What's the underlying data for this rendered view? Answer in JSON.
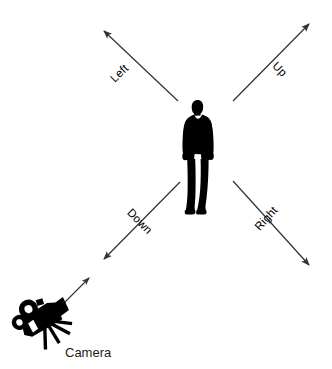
{
  "figure": {
    "background_color": "#ffffff",
    "stroke_color": "#333333",
    "silhouette_color": "#000000"
  },
  "subject": {
    "name": "person-silhouette",
    "description": "standing man silhouette"
  },
  "camera": {
    "name": "movie-camera-icon",
    "label": "Camera",
    "label_color": "#1a1a1a"
  },
  "axes": [
    {
      "id": "left",
      "label": "Left",
      "direction": "up-left",
      "rotation_deg": -42,
      "arrowhead": "end",
      "from": {
        "x": 178,
        "y": 101
      },
      "to": {
        "x": 101,
        "y": 28
      },
      "label_pos": {
        "x": 122,
        "y": 76
      }
    },
    {
      "id": "up",
      "label": "Up",
      "direction": "up-right",
      "rotation_deg": 42,
      "arrowhead": "end",
      "from": {
        "x": 233,
        "y": 101
      },
      "to": {
        "x": 312,
        "y": 21
      },
      "label_pos": {
        "x": 277,
        "y": 72
      }
    },
    {
      "id": "down",
      "label": "Down",
      "direction": "down-left",
      "rotation_deg": 42,
      "arrowhead": "end",
      "from": {
        "x": 180,
        "y": 182
      },
      "to": {
        "x": 101,
        "y": 262
      },
      "label_pos": {
        "x": 136,
        "y": 224
      }
    },
    {
      "id": "right",
      "label": "Right",
      "direction": "down-right",
      "rotation_deg": -42,
      "arrowhead": "end",
      "from": {
        "x": 233,
        "y": 181
      },
      "to": {
        "x": 312,
        "y": 268
      },
      "label_pos": {
        "x": 268,
        "y": 221
      }
    }
  ],
  "sightline": {
    "id": "camera-sightline",
    "description": "arrow from camera toward the scene origin",
    "arrowhead": "end",
    "from": {
      "x": 57,
      "y": 310
    },
    "to": {
      "x": 92,
      "y": 275
    }
  }
}
